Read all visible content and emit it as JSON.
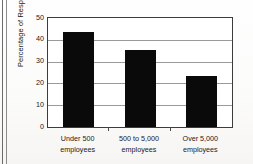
{
  "chart_data": {
    "type": "bar",
    "title": "",
    "subtitle": "",
    "xlabel": "",
    "ylabel": "Percentage of Respondents",
    "categories": [
      "Under 500 employees",
      "500 to 5,000 employees",
      "Over 5,000 employees"
    ],
    "category_lines": [
      [
        "Under 500",
        "employees"
      ],
      [
        "500 to 5,000",
        "employees"
      ],
      [
        "Over 5,000",
        "employees"
      ]
    ],
    "values": [
      43.5,
      35.4,
      23.5
    ],
    "ylim": [
      0,
      50
    ],
    "ytick_labels": [
      "50",
      "40",
      "30",
      "20",
      "10",
      "0"
    ],
    "ytick_values": [
      50,
      40,
      30,
      20,
      10,
      0
    ],
    "grid": true,
    "grid_axis": "y",
    "legend": false,
    "legend_position": "none",
    "bar_color": "#0a0a0a",
    "frame_color": "#3c3c3c",
    "grid_color": "#9a9a9a",
    "background_color": "#ffffff"
  }
}
